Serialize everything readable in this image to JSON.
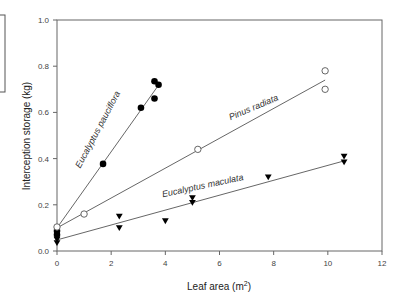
{
  "chart_data": {
    "type": "scatter",
    "title": "",
    "xlabel": "Leaf area (m",
    "xlabel_sup": "2",
    "xlabel_suffix": ")",
    "ylabel": "Interception storage (kg)",
    "xlim": [
      0,
      12
    ],
    "ylim": [
      0.0,
      1.0
    ],
    "xticks": [
      0,
      2,
      4,
      6,
      8,
      10,
      12
    ],
    "yticks": [
      "0.0",
      "0.2",
      "0.4",
      "0.6",
      "0.8",
      "1.0"
    ],
    "grid": false,
    "legend": "none (inline labels)",
    "series": [
      {
        "name": "Eucalyptus pauciflora",
        "marker": "filled-circle",
        "points": [
          [
            0,
            0.087
          ],
          [
            0,
            0.07
          ],
          [
            1.7,
            0.377
          ],
          [
            3.1,
            0.62
          ],
          [
            3.6,
            0.66
          ],
          [
            3.6,
            0.735
          ],
          [
            3.75,
            0.72
          ]
        ],
        "fit_line": [
          [
            0,
            0.1
          ],
          [
            3.7,
            0.71
          ]
        ]
      },
      {
        "name": "Pinus radiata",
        "marker": "open-circle",
        "points": [
          [
            0,
            0.104
          ],
          [
            1.0,
            0.16
          ],
          [
            5.2,
            0.44
          ],
          [
            9.9,
            0.78
          ],
          [
            9.9,
            0.7
          ]
        ],
        "fit_line": [
          [
            0,
            0.1
          ],
          [
            9.9,
            0.74
          ]
        ]
      },
      {
        "name": "Eucalyptus maculata",
        "marker": "filled-down-triangle",
        "points": [
          [
            0,
            0.05
          ],
          [
            0,
            0.035
          ],
          [
            2.3,
            0.15
          ],
          [
            2.3,
            0.1
          ],
          [
            4.0,
            0.13
          ],
          [
            5.0,
            0.23
          ],
          [
            5.0,
            0.21
          ],
          [
            7.8,
            0.32
          ],
          [
            10.6,
            0.41
          ],
          [
            10.6,
            0.385
          ]
        ],
        "fit_line": [
          [
            0,
            0.048
          ],
          [
            10.6,
            0.39
          ]
        ]
      }
    ],
    "annotations": [
      {
        "text": "Eucalyptus pauciflora",
        "x": 1.6,
        "y": 0.52,
        "rotation": -62
      },
      {
        "text": "Pinus radiata",
        "x": 7.3,
        "y": 0.61,
        "rotation": -23
      },
      {
        "text": "Eucalyptus maculata",
        "x": 5.4,
        "y": 0.27,
        "rotation": -12
      }
    ]
  }
}
